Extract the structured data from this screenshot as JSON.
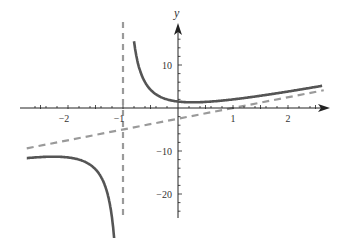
{
  "chart_data": {
    "type": "line",
    "title": "",
    "xlabel": "",
    "ylabel": "y",
    "xlim": [
      -2.8,
      2.7
    ],
    "ylim": [
      -26,
      17
    ],
    "x_ticks": [
      -2,
      -1,
      1,
      2
    ],
    "x_tick_labels": [
      "−2",
      "−1",
      "1",
      "2"
    ],
    "y_ticks": [
      10,
      -10,
      -20
    ],
    "y_tick_labels": [
      "10",
      "−10",
      "−20"
    ],
    "grid": false,
    "legend": null,
    "series": [
      {
        "name": "f(x) = 2.5x − 2.5 + 4/(x+1)",
        "style": "solid",
        "color": "#555555",
        "description": "rational function with vertical asymptote x = -1",
        "sample_points": [
          [
            -2.7,
            -11.6
          ],
          [
            -2.0,
            -11.5
          ],
          [
            -1.5,
            -14.25
          ],
          [
            -1.2,
            -25.5
          ],
          [
            -0.75,
            11.1
          ],
          [
            -0.5,
            4.25
          ],
          [
            0,
            1.5
          ],
          [
            0.26,
            1.3
          ],
          [
            1,
            2.0
          ],
          [
            2,
            3.83
          ],
          [
            2.6,
            5.11
          ]
        ]
      },
      {
        "name": "vertical asymptote x = -1",
        "style": "dashed",
        "color": "#999999"
      },
      {
        "name": "oblique asymptote y = 2.5x - 2.5",
        "style": "dashed",
        "color": "#999999",
        "sample_points": [
          [
            -2.7,
            -9.25
          ],
          [
            0,
            -2.5
          ],
          [
            2.6,
            4.0
          ]
        ]
      }
    ]
  }
}
